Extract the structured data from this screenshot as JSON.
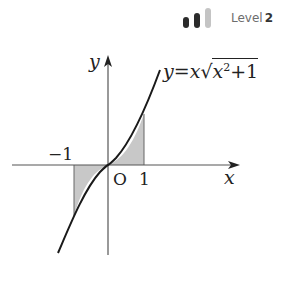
{
  "badge": {
    "level_label": "Level",
    "level_value": "2",
    "bars": [
      {
        "height": 11,
        "color": "#2b2b2b"
      },
      {
        "height": 15,
        "color": "#2b2b2b"
      },
      {
        "height": 20,
        "color": "#c4c4c4"
      }
    ]
  },
  "graph": {
    "x_axis_label": "x",
    "y_axis_label": "y",
    "origin_label": "O",
    "tick_neg1": "−1",
    "tick_pos1": "1",
    "equation": {
      "lhs": "y",
      "eq": "=",
      "x": "x",
      "radicand_base": "x",
      "exponent": "2",
      "plus_one": "+1"
    },
    "colors": {
      "curve": "#1a1a1a",
      "axis": "#555555",
      "shade": "#c8c8c8"
    }
  }
}
